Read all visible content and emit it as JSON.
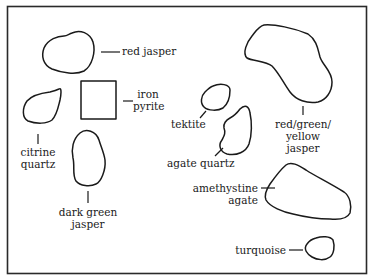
{
  "diagram": {
    "type": "specimen-outline-key",
    "labels": {
      "red_jasper": "red jasper",
      "iron_pyrite_1": "iron",
      "iron_pyrite_2": "pyrite",
      "citrine_quartz_1": "citrine",
      "citrine_quartz_2": "quartz",
      "dark_green_jasper_1": "dark green",
      "dark_green_jasper_2": "jasper",
      "tektite": "tektite",
      "agate_quartz": "agate quartz",
      "rgy_jasper_1": "red/green/",
      "rgy_jasper_2": "yellow",
      "rgy_jasper_3": "jasper",
      "amethystine_agate_1": "amethystine",
      "amethystine_agate_2": "agate",
      "turquoise": "turquoise"
    },
    "colors": {
      "line": "#1a1a1a",
      "background": "#ffffff"
    }
  }
}
